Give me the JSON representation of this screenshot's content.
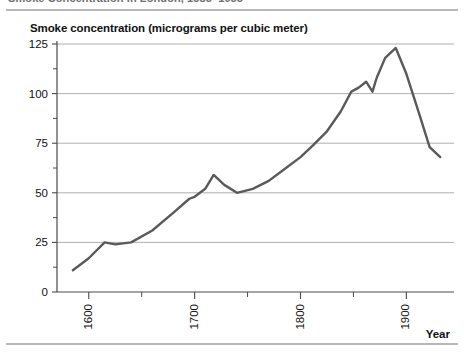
{
  "page": {
    "title_cropped": "Smoke Concentration in London, 1585–1935"
  },
  "figure": {
    "axis_title": "Smoke concentration (micrograms per cubic meter)",
    "xaxis_name": "Year"
  },
  "chart_data": {
    "type": "line",
    "title": "Smoke concentration (micrograms per cubic meter)",
    "xlabel": "Year",
    "ylabel": "Smoke concentration (micrograms per cubic meter)",
    "xlim": [
      1570,
      1945
    ],
    "ylim": [
      0,
      125
    ],
    "grid": true,
    "legend": "none",
    "accent_color": "#5a5a5a",
    "gridline_color": "#9a9a9a",
    "x_ticks_major": [
      1600,
      1700,
      1800,
      1900
    ],
    "x_ticks_major_labels": [
      "1600",
      "1700",
      "1800",
      "1900"
    ],
    "x_ticks_minor": [
      1650,
      1750,
      1850
    ],
    "y_ticks_major": [
      0,
      25,
      50,
      75,
      100,
      125
    ],
    "y_ticks_major_labels": [
      "0",
      "25",
      "50",
      "75",
      "100",
      "125"
    ],
    "y_ticks_minor": [
      12.5,
      37.5,
      62.5,
      87.5,
      112.5
    ],
    "series": [
      {
        "name": "Smoke concentration",
        "x": [
          1585,
          1600,
          1615,
          1625,
          1640,
          1660,
          1680,
          1695,
          1700,
          1710,
          1718,
          1728,
          1740,
          1755,
          1770,
          1785,
          1800,
          1812,
          1825,
          1838,
          1848,
          1855,
          1862,
          1868,
          1872,
          1880,
          1890,
          1900,
          1912,
          1922,
          1932
        ],
        "values": [
          11,
          17,
          25,
          24,
          25,
          31,
          40,
          47,
          48,
          52,
          59,
          54,
          50,
          52,
          56,
          62,
          68,
          74,
          81,
          91,
          101,
          103,
          106,
          101,
          108,
          118,
          123,
          110,
          90,
          73,
          68
        ]
      }
    ]
  }
}
